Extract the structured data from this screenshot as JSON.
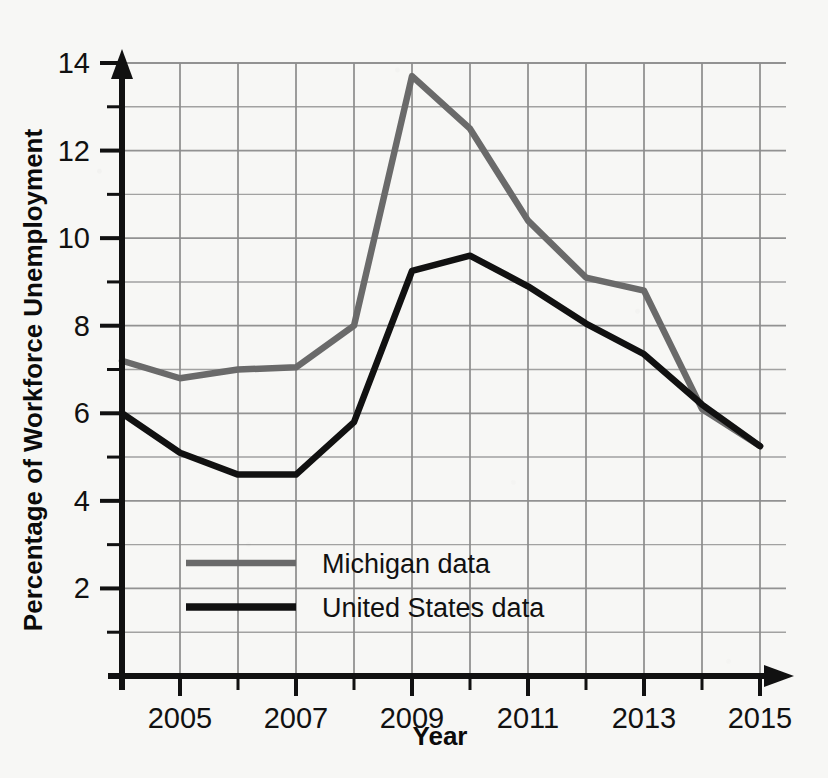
{
  "chart_data": {
    "type": "line",
    "title": "",
    "xlabel": "Year",
    "ylabel": "Percentage of Workforce Unemployment",
    "x": [
      2004,
      2005,
      2006,
      2007,
      2008,
      2009,
      2010,
      2011,
      2012,
      2013,
      2014,
      2015
    ],
    "xlim": [
      2004,
      2015
    ],
    "ylim": [
      0,
      14
    ],
    "x_tick_labels": [
      "2005",
      "2007",
      "2009",
      "2011",
      "2013",
      "2015"
    ],
    "x_tick_values": [
      2005,
      2007,
      2009,
      2011,
      2013,
      2015
    ],
    "x_minor_ticks": [
      2004,
      2006,
      2008,
      2010,
      2012,
      2014
    ],
    "y_tick_labels": [
      "2",
      "4",
      "6",
      "8",
      "10",
      "12",
      "14"
    ],
    "y_tick_values": [
      2,
      4,
      6,
      8,
      10,
      12,
      14
    ],
    "y_minor_ticks": [
      1,
      3,
      5,
      7,
      9,
      11,
      13
    ],
    "grid": true,
    "legend_position": "inside-lower-left",
    "series": [
      {
        "name": "Michigan data",
        "color": "#6a6a6a",
        "values": [
          7.2,
          6.8,
          7.0,
          7.05,
          8.0,
          13.7,
          12.5,
          10.4,
          9.1,
          8.8,
          6.1,
          5.25
        ]
      },
      {
        "name": "United States data",
        "color": "#111111",
        "values": [
          6.0,
          5.1,
          4.6,
          4.6,
          5.8,
          9.25,
          9.6,
          8.9,
          8.05,
          7.35,
          6.2,
          5.25
        ]
      }
    ],
    "legend": [
      {
        "label": "Michigan data",
        "color": "#6a6a6a",
        "swatch": "line-swatch-gray"
      },
      {
        "label": "United States data",
        "color": "#111111",
        "swatch": "line-swatch-black"
      }
    ],
    "axis_color": "#111111",
    "grid_color": "#8d8d8d",
    "background_color": "#f7f7f5"
  }
}
